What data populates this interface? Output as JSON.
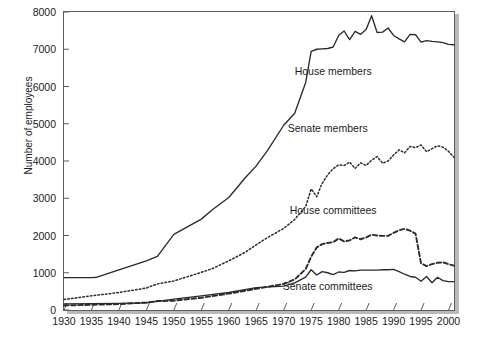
{
  "chart_data": {
    "type": "line",
    "title": "",
    "xlabel": "",
    "ylabel": "Number of employees",
    "xlim": [
      1930,
      2001
    ],
    "ylim": [
      0,
      8000
    ],
    "grid": false,
    "legend_position": "inline-annotations",
    "x_ticks": [
      1930,
      1935,
      1940,
      1945,
      1950,
      1955,
      1960,
      1965,
      1970,
      1975,
      1980,
      1985,
      1990,
      1995,
      2000
    ],
    "y_ticks": [
      0,
      1000,
      2000,
      3000,
      4000,
      5000,
      6000,
      7000,
      8000
    ],
    "series": [
      {
        "name": "House members",
        "style": "solid",
        "color": "#2b2b2b",
        "x": [
          1930,
          1935,
          1936,
          1940,
          1945,
          1947,
          1950,
          1955,
          1957,
          1960,
          1963,
          1965,
          1967,
          1970,
          1972,
          1974,
          1975,
          1976,
          1977,
          1978,
          1979,
          1980,
          1981,
          1982,
          1983,
          1984,
          1985,
          1986,
          1987,
          1988,
          1989,
          1990,
          1991,
          1992,
          1993,
          1994,
          1995,
          1996,
          1997,
          1998,
          1999,
          2000,
          2001
        ],
        "values": [
          870,
          870,
          880,
          1080,
          1320,
          1440,
          2030,
          2440,
          2690,
          3020,
          3550,
          3870,
          4270,
          4960,
          5280,
          6110,
          6940,
          7000,
          7010,
          7020,
          7060,
          7370,
          7490,
          7260,
          7480,
          7400,
          7530,
          7900,
          7450,
          7460,
          7570,
          7370,
          7280,
          7200,
          7400,
          7390,
          7190,
          7230,
          7210,
          7200,
          7180,
          7130,
          7120
        ]
      },
      {
        "name": "Senate members",
        "style": "dotted",
        "color": "#2b2b2b",
        "x": [
          1930,
          1935,
          1940,
          1945,
          1947,
          1950,
          1955,
          1957,
          1960,
          1963,
          1965,
          1967,
          1970,
          1972,
          1974,
          1975,
          1976,
          1977,
          1978,
          1979,
          1980,
          1981,
          1982,
          1983,
          1984,
          1985,
          1986,
          1987,
          1988,
          1989,
          1990,
          1991,
          1992,
          1993,
          1994,
          1995,
          1996,
          1997,
          1998,
          1999,
          2000,
          2001
        ],
        "values": [
          280,
          380,
          470,
          590,
          700,
          780,
          1010,
          1110,
          1320,
          1550,
          1750,
          1940,
          2190,
          2430,
          2780,
          3250,
          3040,
          3400,
          3630,
          3790,
          3900,
          3880,
          3970,
          3800,
          3950,
          3880,
          4020,
          4120,
          3940,
          4000,
          4160,
          4300,
          4220,
          4390,
          4360,
          4430,
          4250,
          4330,
          4410,
          4370,
          4260,
          4100
        ]
      },
      {
        "name": "House committees",
        "style": "dashed",
        "color": "#2b2b2b",
        "x": [
          1930,
          1935,
          1940,
          1945,
          1947,
          1950,
          1955,
          1960,
          1965,
          1970,
          1972,
          1974,
          1975,
          1976,
          1977,
          1978,
          1979,
          1980,
          1981,
          1982,
          1983,
          1984,
          1985,
          1986,
          1987,
          1988,
          1989,
          1990,
          1991,
          1992,
          1993,
          1994,
          1995,
          1996,
          1997,
          1998,
          1999,
          2000,
          2001
        ],
        "values": [
          120,
          140,
          160,
          200,
          240,
          250,
          330,
          440,
          570,
          700,
          820,
          1100,
          1430,
          1680,
          1770,
          1800,
          1820,
          1920,
          1840,
          1870,
          1950,
          1900,
          1950,
          2020,
          2000,
          1990,
          1990,
          2070,
          2140,
          2180,
          2130,
          2050,
          1250,
          1180,
          1230,
          1270,
          1280,
          1230,
          1190
        ]
      },
      {
        "name": "Senate committees",
        "style": "solid",
        "color": "#2b2b2b",
        "x": [
          1930,
          1935,
          1940,
          1945,
          1947,
          1950,
          1955,
          1960,
          1965,
          1970,
          1972,
          1974,
          1975,
          1976,
          1977,
          1978,
          1979,
          1980,
          1981,
          1982,
          1983,
          1984,
          1985,
          1986,
          1987,
          1988,
          1989,
          1990,
          1991,
          1992,
          1993,
          1994,
          1995,
          1996,
          1997,
          1998,
          1999,
          2000,
          2001
        ],
        "values": [
          160,
          170,
          180,
          190,
          230,
          290,
          380,
          470,
          600,
          640,
          730,
          880,
          1080,
          940,
          1030,
          1000,
          950,
          1020,
          1010,
          1060,
          1050,
          1070,
          1070,
          1070,
          1070,
          1080,
          1080,
          1090,
          1030,
          960,
          900,
          880,
          770,
          900,
          730,
          880,
          790,
          760,
          760
        ]
      }
    ]
  },
  "annotations": [
    {
      "label": "House members",
      "x": 1979,
      "y": 6400
    },
    {
      "label": "Senate members",
      "x": 1978,
      "y": 4850
    },
    {
      "label": "House committees",
      "x": 1979,
      "y": 2650
    },
    {
      "label": "Senate committees",
      "x": 1978,
      "y": 620
    }
  ]
}
